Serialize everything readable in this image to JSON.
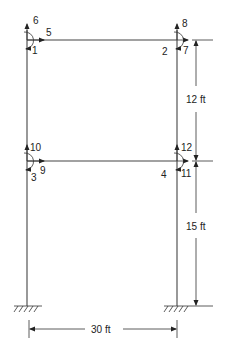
{
  "diagram": {
    "type": "two-story portal frame",
    "colors": {
      "line": "#444444",
      "text": "#222222",
      "background": "#ffffff"
    },
    "joints": [
      {
        "id": "top-left",
        "moment": "1",
        "horizontal": "5",
        "vertical": "6"
      },
      {
        "id": "top-right",
        "moment": "2",
        "horizontal": "7",
        "vertical": "8"
      },
      {
        "id": "mid-left",
        "moment": "3",
        "horizontal": "9",
        "vertical": "10"
      },
      {
        "id": "mid-right",
        "moment": "4",
        "horizontal": "11",
        "vertical": "12"
      }
    ],
    "labels": {
      "l1": "1",
      "l2": "2",
      "l3": "3",
      "l4": "4",
      "l5": "5",
      "l6": "6",
      "l7": "7",
      "l8": "8",
      "l9": "9",
      "l10": "10",
      "l11": "11",
      "l12": "12"
    },
    "dimensions": {
      "upper_story": "12 ft",
      "lower_story": "15 ft",
      "span": "30 ft"
    },
    "supports": [
      "fixed",
      "fixed"
    ]
  }
}
